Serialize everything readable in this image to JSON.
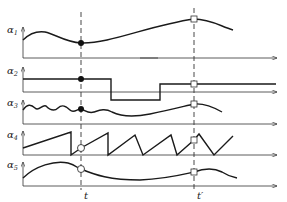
{
  "figure": {
    "type": "timing-diagram",
    "time_markers": [
      {
        "id": "t",
        "label": "t",
        "marker_style": "filled-dot on a1,a2,a3; open-circle on a4,a5"
      },
      {
        "id": "t_prime",
        "label": "t′",
        "marker_style": "open-square on all traces"
      }
    ],
    "traces": [
      {
        "id": "a1",
        "symbol": "α",
        "subscript": "1",
        "shape": "smooth wave",
        "marker_t": "filled",
        "marker_tp": "square"
      },
      {
        "id": "a2",
        "symbol": "α",
        "subscript": "2",
        "shape": "step: high, low, high",
        "marker_t": "filled",
        "marker_tp": "square"
      },
      {
        "id": "a3",
        "symbol": "α",
        "subscript": "3",
        "shape": "wiggly oscillation",
        "marker_t": "filled",
        "marker_tp": "square"
      },
      {
        "id": "a4",
        "symbol": "α",
        "subscript": "4",
        "shape": "sawtooth",
        "marker_t": "open-circle",
        "marker_tp": "square"
      },
      {
        "id": "a5",
        "symbol": "α",
        "subscript": "5",
        "shape": "rise then fall",
        "marker_t": "open-circle",
        "marker_tp": "square"
      }
    ]
  }
}
